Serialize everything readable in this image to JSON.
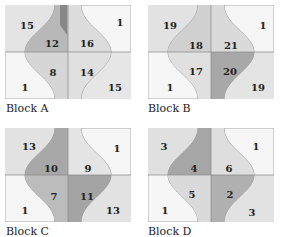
{
  "diagram": {
    "blocks": [
      {
        "id": "A",
        "caption": "Block A",
        "numbers": {
          "tl": "15",
          "tr": "1",
          "ctl": "12",
          "ctr": "16",
          "cbl": "8",
          "cbr": "14",
          "bl": "1",
          "br": "15"
        }
      },
      {
        "id": "B",
        "caption": "Block B",
        "numbers": {
          "tl": "19",
          "tr": "1",
          "ctl": "18",
          "ctr": "21",
          "cbl": "17",
          "cbr": "20",
          "bl": "1",
          "br": "19"
        }
      },
      {
        "id": "C",
        "caption": "Block C",
        "numbers": {
          "tl": "13",
          "tr": "1",
          "ctl": "10",
          "ctr": "9",
          "cbl": "7",
          "cbr": "11",
          "bl": "1",
          "br": "13"
        }
      },
      {
        "id": "D",
        "caption": "Block D",
        "numbers": {
          "tl": "3",
          "tr": "1",
          "ctl": "4",
          "ctr": "6",
          "cbl": "5",
          "cbr": "2",
          "bl": "1",
          "br": "3"
        }
      }
    ]
  },
  "colors": {
    "outline": "#888888",
    "light_fabric": "#e6e6e6",
    "mid_fabric": "#c8c8c8",
    "dark_fabric": "#9a9a9a",
    "background": "#ffffff",
    "text": "#222222"
  }
}
